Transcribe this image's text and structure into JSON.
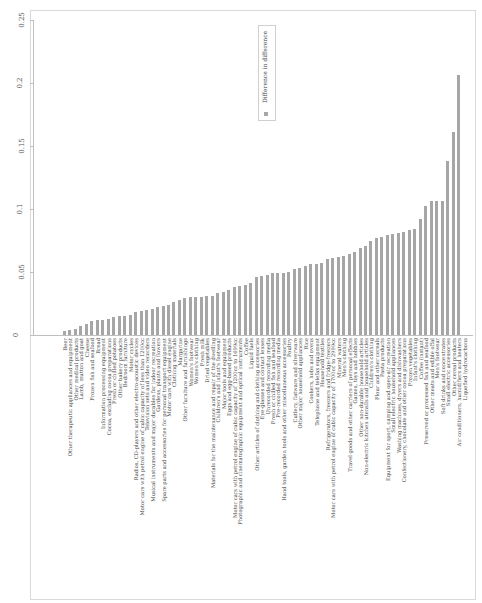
{
  "chart_data": {
    "type": "bar",
    "orientation": "vertical bars, image rotated 90 degrees",
    "title": "",
    "xlabel": "",
    "ylabel": "",
    "ylim": [
      0,
      0.25
    ],
    "yticks": [
      "0",
      "0.05",
      "0.1",
      "0.15",
      "0.2",
      "0.25"
    ],
    "legend": {
      "position": "top-center",
      "entries": [
        "Difference in difference"
      ]
    },
    "grid": false,
    "bar_color": "#a6a6a6",
    "categories": [
      "Beer",
      "Other therapeutic appliances and equipment",
      "Other medical products",
      "Lamb, mutton and goat",
      "Cheese",
      "Frozen fish and seafood",
      "Bread",
      "Information processing equipment",
      "Cocoa, excluding cocoa preparations",
      "Fresh or chilled potatoes",
      "Other bakery products",
      "Bedroom furniture",
      "Motor cycles",
      "Radios, CD-players and other electro-acoustic devices",
      "Motor cars with petrol engine of cubic capacity of less than 1200cc",
      "Television sets and video recorders",
      "Musical instruments and major durables for indoor recreation",
      "Gardens, plants and flowers",
      "Spare parts and accessories for personal transport equipment",
      "Motor cars with diesel engine",
      "Clothing materials",
      "Margarine",
      "Other furniture and furnishings",
      "Women's footwear",
      "Women's clothing",
      "Fresh milk",
      "Dried vegetables",
      "Materials for the maintenance and repair of the dwelling",
      "Children's and infant's footwear",
      "Major tools and equipment",
      "Eggs and egg-based products",
      "Motor cars with petrol engine of cubic capacity of 1200cc to 1699cc",
      "Photographic and cinematographic equipment and optical instruments",
      "Coffee",
      "Liquid fuels",
      "Other articles of clothing and clothing accessories",
      "Eye-glasses and contact lenses",
      "Unrecorded recording media",
      "Fresh or chilled fish and seafood",
      "Pre-recorded recording media",
      "Hand tools, garden tools and other miscellaneous accessories",
      "Poultry",
      "Cutlery, flatware and silverware",
      "Other major household appliances",
      "Rice",
      "Cookers, hobs and ovens",
      "Telephone and telefax equipment",
      "Household textiles",
      "Refrigerators, freezers and fridge-freezers",
      "Motor cars with petrol engine of cubic capacity of 1700cc to 2999cc",
      "Mineral waters",
      "Men's clothing",
      "Travel goods and other carriers of personal effects",
      "Games, toys and hobbies",
      "Other non-durable household articles",
      "Non-electric kitchen utensils and household articles",
      "Children's clothing",
      "Flour and other cereals",
      "Pasta products",
      "Equipment for sport, camping and open-air recreation",
      "Small electric household appliances",
      "Washing machines, dryers and dishwashers",
      "Confectionery, chocolate and other cocoa preparations",
      "Frozen vegetables",
      "Infant's clothing",
      "Coffee (instant)",
      "Preserved or processed fish and seafood",
      "Other meats and edible offal",
      "Men's footwear",
      "Soft drinks and concentrates",
      "Small electric accessories",
      "Other cereal products",
      "Air conditioners, humidifiers and heaters",
      "Liquefied hydrocarbons"
    ],
    "values": [
      0.003,
      0.004,
      0.005,
      0.007,
      0.009,
      0.011,
      0.012,
      0.012,
      0.013,
      0.014,
      0.015,
      0.015,
      0.016,
      0.018,
      0.019,
      0.02,
      0.021,
      0.022,
      0.023,
      0.024,
      0.026,
      0.028,
      0.029,
      0.03,
      0.03,
      0.03,
      0.031,
      0.031,
      0.033,
      0.034,
      0.036,
      0.038,
      0.039,
      0.04,
      0.041,
      0.046,
      0.047,
      0.048,
      0.049,
      0.049,
      0.049,
      0.05,
      0.052,
      0.053,
      0.055,
      0.056,
      0.056,
      0.057,
      0.06,
      0.061,
      0.062,
      0.063,
      0.064,
      0.066,
      0.069,
      0.071,
      0.075,
      0.077,
      0.078,
      0.079,
      0.08,
      0.081,
      0.082,
      0.083,
      0.084,
      0.092,
      0.102,
      0.106,
      0.106,
      0.106,
      0.138,
      0.161,
      0.206,
      0.0
    ],
    "series": [
      {
        "name": "Difference in difference"
      }
    ]
  }
}
